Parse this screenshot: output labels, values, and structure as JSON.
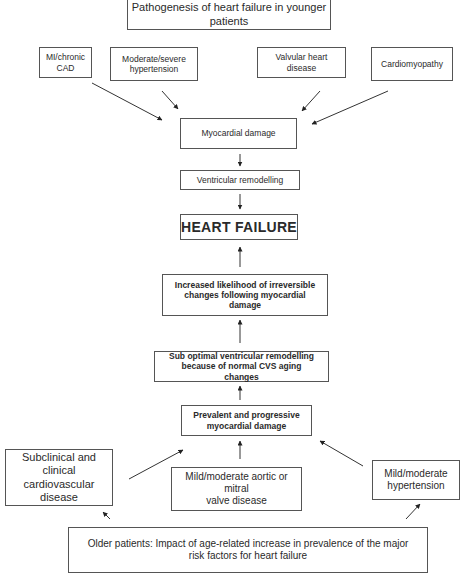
{
  "diagram": {
    "title": "Pathogenesis of heart failure in younger\npatients",
    "younger_causes": [
      {
        "label": "MI/chronic\nCAD"
      },
      {
        "label": "Moderate/severe\nhypertension"
      },
      {
        "label": "Valvular  heart\ndisease"
      },
      {
        "label": "Cardiomyopathy"
      }
    ],
    "myocardial_damage": "Myocardial damage",
    "ventricular_remodelling": "Ventricular remodelling",
    "heart_failure": "HEART FAILURE",
    "increased_likelihood": "Increased likelihood of irreversible\nchanges following myocardial\ndamage",
    "sub_optimal": "Sub optimal ventricular remodelling\nbecause of normal CVS aging\nchanges",
    "prevalent": "Prevalent and progressive\nmyocardial damage",
    "older_causes": [
      {
        "label": "Subclinical and\nclinical\ncardiovascular\ndisease"
      },
      {
        "label": "Mild/moderate aortic or\nmitral\nvalve disease"
      },
      {
        "label": "Mild/moderate\nhypertension"
      }
    ],
    "older_patients": "Older patients: Impact of age-related increase in prevalence of the major\nrisk factors for heart failure"
  }
}
